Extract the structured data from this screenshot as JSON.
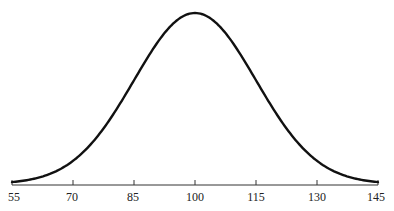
{
  "chart_data": {
    "type": "line",
    "title": "",
    "xlabel": "",
    "ylabel": "",
    "mean": 100,
    "sd": 15,
    "xlim": [
      55,
      145
    ],
    "x_ticks": [
      55,
      70,
      85,
      100,
      115,
      130,
      145
    ],
    "x_tick_labels": [
      "55",
      "70",
      "85",
      "100",
      "115",
      "130",
      "145"
    ],
    "grid": false,
    "legend": null,
    "series": [
      {
        "name": "normal-curve",
        "x": [
          55,
          60,
          65,
          70,
          75,
          80,
          85,
          90,
          95,
          100,
          105,
          110,
          115,
          120,
          125,
          130,
          135,
          140,
          145
        ],
        "y": [
          0.0111,
          0.0286,
          0.0657,
          0.1353,
          0.2494,
          0.4111,
          0.6065,
          0.8007,
          0.946,
          1.0,
          0.946,
          0.8007,
          0.6065,
          0.4111,
          0.2494,
          0.1353,
          0.0657,
          0.0286,
          0.0111
        ]
      }
    ]
  },
  "axis": {
    "labels": [
      "55",
      "70",
      "85",
      "100",
      "115",
      "130",
      "145"
    ]
  }
}
